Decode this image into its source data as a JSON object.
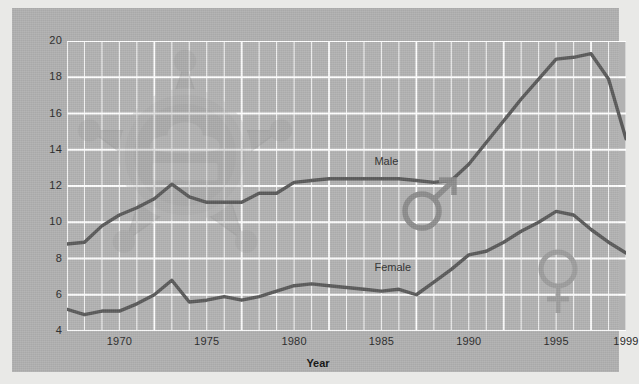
{
  "chart_data": {
    "type": "line",
    "title": "",
    "xlabel": "Year",
    "ylabel": "",
    "xlim": [
      1967,
      1999
    ],
    "ylim": [
      4,
      20
    ],
    "ytick_values": [
      4,
      6,
      8,
      10,
      12,
      14,
      16,
      18,
      20
    ],
    "xtick_values": [
      1970,
      1975,
      1980,
      1985,
      1990,
      1995,
      1999
    ],
    "xtick_labels": [
      "1970",
      "1975",
      "1980",
      "1985",
      "1990",
      "1995",
      "1999"
    ],
    "grid": true,
    "grid_color": "#ffffff",
    "legend_position": "inline-annotations",
    "x": [
      1967,
      1968,
      1969,
      1970,
      1971,
      1972,
      1973,
      1974,
      1975,
      1976,
      1977,
      1978,
      1979,
      1980,
      1981,
      1982,
      1983,
      1984,
      1985,
      1986,
      1987,
      1988,
      1989,
      1990,
      1991,
      1992,
      1993,
      1994,
      1995,
      1996,
      1997,
      1998,
      1999
    ],
    "series": [
      {
        "name": "Male",
        "color": "#5a5a5a",
        "values": [
          8.8,
          8.9,
          9.8,
          10.4,
          10.8,
          11.3,
          12.1,
          11.4,
          11.1,
          11.1,
          11.1,
          11.6,
          11.6,
          12.2,
          12.3,
          12.4,
          12.4,
          12.4,
          12.4,
          12.4,
          12.3,
          12.2,
          12.3,
          13.2,
          14.4,
          15.6,
          16.8,
          17.9,
          19.0,
          19.1,
          19.3,
          17.9,
          14.6
        ]
      },
      {
        "name": "Female",
        "color": "#5a5a5a",
        "values": [
          5.2,
          4.9,
          5.1,
          5.1,
          5.5,
          6.0,
          6.8,
          5.6,
          5.7,
          5.9,
          5.7,
          5.9,
          6.2,
          6.5,
          6.6,
          6.5,
          6.4,
          6.3,
          6.2,
          6.3,
          6.0,
          6.7,
          7.4,
          8.2,
          8.4,
          8.9,
          9.5,
          10.0,
          10.6,
          10.4,
          9.6,
          8.9,
          8.3
        ]
      }
    ],
    "annotations": [
      {
        "name": "male-series-label",
        "text": "Male",
        "x": 1984.6,
        "y": 13.3
      },
      {
        "name": "female-series-label",
        "text": "Female",
        "x": 1984.6,
        "y": 7.5
      }
    ],
    "watermark": {
      "name": "sheriff-badge-watermark",
      "description": "star badge with cap emblem"
    },
    "overlays": [
      {
        "name": "male-gender-symbol",
        "glyph": "mars",
        "x": 1990.2,
        "y": 12.4
      },
      {
        "name": "female-gender-symbol",
        "glyph": "venus",
        "x": 1992.3,
        "y": 9.2
      }
    ]
  },
  "colors": {
    "panel_background": "#b0b0b0",
    "plot_background": "#b2b2b2",
    "grid": "#ffffff",
    "line": "#5a5a5a",
    "text": "#2a2a2a",
    "page_background": "#e9e9e7"
  }
}
